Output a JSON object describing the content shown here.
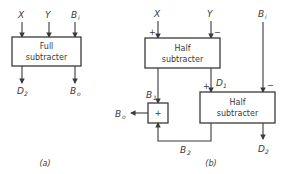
{
  "diagram_a": {
    "caption": "(a)",
    "block": {
      "line1": "Full",
      "line2": "subtracter"
    },
    "inputs": [
      {
        "name": "X",
        "sub": ""
      },
      {
        "name": "Y",
        "sub": ""
      },
      {
        "name": "B",
        "sub": "i"
      }
    ],
    "outputs": [
      {
        "name": "D",
        "sub": "2"
      },
      {
        "name": "B",
        "sub": "o"
      }
    ]
  },
  "diagram_b": {
    "caption": "(b)",
    "half1": {
      "line1": "Half",
      "line2": "subtracter",
      "plus": "+",
      "minus": "−"
    },
    "half2": {
      "line1": "Half",
      "line2": "subtracter",
      "plus": "+",
      "minus": "−"
    },
    "or_gate": {
      "symbol": "+"
    },
    "inputs": {
      "x": {
        "name": "X",
        "sub": ""
      },
      "y": {
        "name": "Y",
        "sub": ""
      },
      "bi": {
        "name": "B",
        "sub": "i"
      }
    },
    "signals": {
      "d1": {
        "name": "D",
        "sub": "1"
      },
      "b1": {
        "name": "B",
        "sub": "1"
      },
      "b2": {
        "name": "B",
        "sub": "2"
      },
      "bo": {
        "name": "B",
        "sub": "o"
      },
      "d2": {
        "name": "D",
        "sub": "2"
      }
    }
  },
  "colors": {
    "ink": "#3a3a3a",
    "background": "#ffffff"
  }
}
